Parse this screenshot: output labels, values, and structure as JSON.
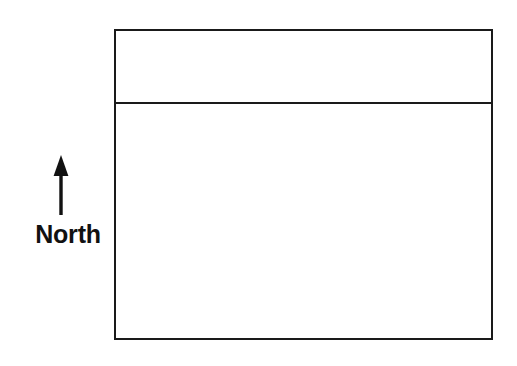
{
  "diagram": {
    "title": "",
    "background_color": "#ffffff",
    "line_color": "#1a1a1a",
    "compass": {
      "arrow_icon_name": "north-arrow-icon",
      "direction": "up",
      "label": "North"
    },
    "plan": {
      "name": "plan-rectangle",
      "upper_section": {
        "label": "",
        "name": "upper-section"
      },
      "lower_section": {
        "label": "",
        "name": "lower-section"
      }
    }
  }
}
